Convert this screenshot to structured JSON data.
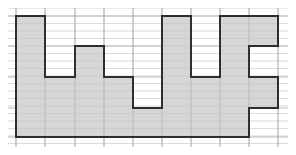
{
  "diagram": {
    "type": "grid-polygon",
    "grid": {
      "x_lines": [
        16,
        45,
        75,
        104,
        133,
        162,
        191,
        220,
        249,
        278
      ],
      "major_y_lines": [
        16,
        46,
        77,
        108,
        137
      ],
      "minor_subdivisions": 4,
      "extent": {
        "x0": 8,
        "x1": 288,
        "y0": 8,
        "y1": 147
      },
      "major_color": "#bdbdbd",
      "minor_color": "#e3e3e3"
    },
    "shape": {
      "fill": "#d6d6d6",
      "stroke": "#2e2e2e",
      "stroke_width": 1.8,
      "columns": [
        {
          "x0": 16,
          "x1": 45,
          "top": 16
        },
        {
          "x0": 45,
          "x1": 75,
          "top": 77
        },
        {
          "x0": 75,
          "x1": 104,
          "top": 46
        },
        {
          "x0": 104,
          "x1": 133,
          "top": 77
        },
        {
          "x0": 133,
          "x1": 162,
          "top": 108
        },
        {
          "x0": 162,
          "x1": 191,
          "top": 16
        },
        {
          "x0": 191,
          "x1": 220,
          "top": 77
        },
        {
          "x0": 220,
          "x1": 249,
          "top": 16
        }
      ],
      "bottom": 137,
      "points": "16,16 45,16 45,77 75,77 75,46 104,46 104,77 133,77 133,108 162,108 162,16 191,16 191,77 220,77 220,16 278,16 278,46 249,46 249,77 278,77 278,108 249,108 249,137 16,137"
    }
  }
}
